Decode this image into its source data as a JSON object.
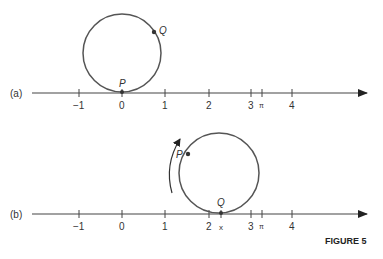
{
  "figure_label": "FIGURE 5",
  "panels": [
    {
      "label": "(a)",
      "ticks": [
        "−1",
        "0",
        "1",
        "2",
        "3",
        "π",
        "4"
      ],
      "points": [
        {
          "name": "P"
        },
        {
          "name": "Q"
        }
      ]
    },
    {
      "label": "(b)",
      "ticks": [
        "−1",
        "0",
        "1",
        "2",
        "x",
        "3",
        "π",
        "4"
      ],
      "points": [
        {
          "name": "P"
        },
        {
          "name": "Q"
        }
      ]
    }
  ],
  "colors": {
    "circle": "#5a5a5a",
    "axis": "#444444",
    "text": "#333333"
  }
}
